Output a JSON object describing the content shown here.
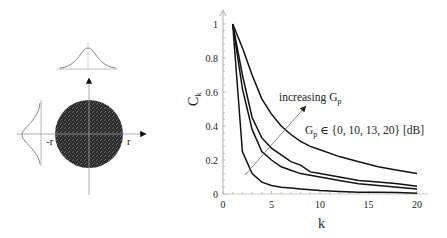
{
  "left_diagram": {
    "label_neg_r": "-r",
    "label_pos_r": "r",
    "circle_color": "#2a2a2a"
  },
  "chart_data": {
    "type": "line",
    "title": "",
    "xlabel": "k",
    "ylabel": "C_k",
    "xlim": [
      0,
      20
    ],
    "ylim": [
      0,
      1
    ],
    "xticks": [
      "0",
      "5",
      "10",
      "15",
      "20"
    ],
    "yticks": [
      "0",
      "0.2",
      "0.4",
      "0.6",
      "0.8",
      "1"
    ],
    "grid": false,
    "annotation_arrow": "increasing G_p",
    "annotation_set": "G_p ∈ {0, 10, 13, 20} [dB]",
    "series": [
      {
        "name": "G_p = 20 dB",
        "x": [
          1,
          2,
          3,
          4,
          5,
          6,
          7,
          8,
          9,
          10,
          12,
          14,
          16,
          18,
          20
        ],
        "values": [
          1.0,
          0.86,
          0.7,
          0.56,
          0.47,
          0.4,
          0.35,
          0.31,
          0.28,
          0.26,
          0.22,
          0.19,
          0.16,
          0.14,
          0.12
        ]
      },
      {
        "name": "G_p = 13 dB",
        "x": [
          1,
          2,
          3,
          4,
          5,
          6,
          7,
          8,
          9,
          10,
          12,
          14,
          16,
          18,
          20
        ],
        "values": [
          1.0,
          0.7,
          0.45,
          0.33,
          0.27,
          0.23,
          0.19,
          0.17,
          0.13,
          0.12,
          0.1,
          0.08,
          0.07,
          0.06,
          0.045
        ]
      },
      {
        "name": "G_p = 10 dB",
        "x": [
          1,
          2,
          3,
          4,
          5,
          6,
          7,
          8,
          9,
          10,
          12,
          14,
          16,
          18,
          20
        ],
        "values": [
          1.0,
          0.62,
          0.38,
          0.25,
          0.2,
          0.16,
          0.14,
          0.12,
          0.11,
          0.1,
          0.08,
          0.06,
          0.05,
          0.04,
          0.03
        ]
      },
      {
        "name": "G_p = 0 dB",
        "x": [
          1,
          2,
          3,
          4,
          5,
          6,
          7,
          8,
          9,
          10,
          12,
          14,
          16,
          18,
          20
        ],
        "values": [
          1.0,
          0.25,
          0.12,
          0.07,
          0.05,
          0.04,
          0.035,
          0.03,
          0.025,
          0.02,
          0.015,
          0.01,
          0.01,
          0.008,
          0.005
        ]
      }
    ]
  }
}
